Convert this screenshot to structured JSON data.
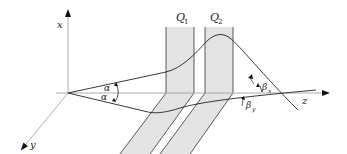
{
  "diagram": {
    "axes": {
      "x": "x",
      "y": "y",
      "z": "z"
    },
    "lenses": [
      {
        "name": "Q",
        "subscript": "1"
      },
      {
        "name": "Q",
        "subscript": "2"
      }
    ],
    "angles": {
      "alpha_upper": "α",
      "alpha_lower": "α",
      "beta_x": {
        "symbol": "β",
        "subscript": "x"
      },
      "beta_y": {
        "symbol": "β",
        "subscript": "y"
      }
    },
    "colors": {
      "lens_fill": "#e3e3e3",
      "line": "#333333",
      "axis": "#888888"
    }
  }
}
